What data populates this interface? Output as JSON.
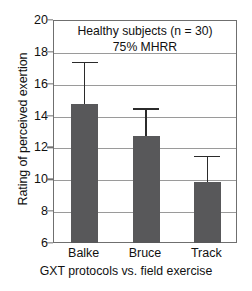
{
  "chart_data": {
    "type": "bar",
    "title": "Healthy subjects (n = 30)",
    "subtitle": "75% MHRR",
    "xlabel": "GXT protocols vs. field exercise",
    "ylabel": "Rating of perceived exertion",
    "categories": [
      "Balke",
      "Bruce",
      "Track"
    ],
    "values": [
      14.8,
      12.8,
      9.9
    ],
    "error_upper": [
      17.45,
      14.55,
      11.55
    ],
    "ylim": [
      6,
      20
    ],
    "yticks": [
      20,
      18,
      16,
      14,
      12,
      10,
      8,
      6
    ],
    "grid": true,
    "legend": "none",
    "bar_color": "#58585a",
    "error_color": "#2b2b2b",
    "axis_color": "#6f6f6f",
    "grid_color": "#9a9a9a"
  },
  "caption_fragment": ""
}
